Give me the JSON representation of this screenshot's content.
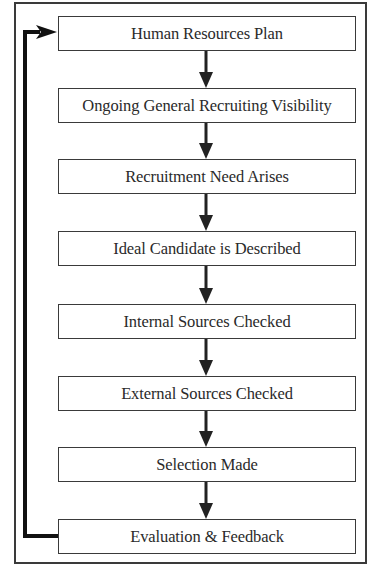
{
  "diagram": {
    "type": "flowchart",
    "direction": "top-to-bottom",
    "steps": [
      {
        "label": "Human Resources Plan"
      },
      {
        "label": "Ongoing General Recruiting Visibility"
      },
      {
        "label": "Recruitment Need Arises"
      },
      {
        "label": "Ideal Candidate is Described"
      },
      {
        "label": "Internal Sources Checked"
      },
      {
        "label": "External Sources Checked"
      },
      {
        "label": "Selection Made"
      },
      {
        "label": "Evaluation & Feedback"
      }
    ],
    "feedback_loop": {
      "from": "Evaluation & Feedback",
      "to": "Human Resources Plan"
    },
    "colors": {
      "line": "#2a2a2a",
      "border": "#3a3a3a",
      "background": "#ffffff"
    }
  }
}
